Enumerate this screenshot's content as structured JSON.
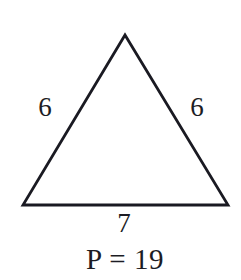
{
  "figure": {
    "type": "geometry-diagram",
    "shape_name": "isosceles-triangle",
    "background_color": "#ffffff",
    "stroke_color": "#1a1a22",
    "text_color": "#1c1c24",
    "stroke_width": 2.8,
    "vertices": {
      "apex": [
        125,
        35
      ],
      "bottom_left": [
        23,
        205
      ],
      "bottom_right": [
        228,
        205
      ]
    },
    "path": "M 125 35 L 23 205 L 228 205 Z"
  },
  "labels": {
    "side_left": "6",
    "side_right": "6",
    "base": "7",
    "perimeter": "P = 19"
  },
  "chart_data": {
    "type": "diagram",
    "title": "",
    "shape": "isosceles triangle",
    "side_lengths": [
      6,
      6,
      7
    ],
    "perimeter": 19,
    "perimeter_expression": "P = 19"
  }
}
